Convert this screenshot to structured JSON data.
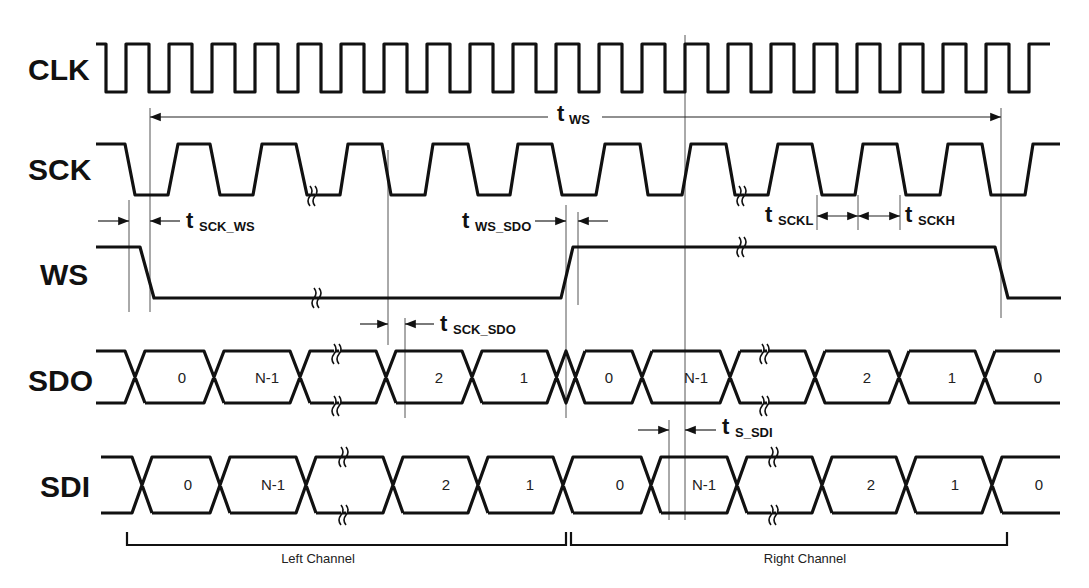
{
  "signals": {
    "clk": "CLK",
    "sck": "SCK",
    "ws": "WS",
    "sdo": "SDO",
    "sdi": "SDI"
  },
  "timing_labels": {
    "t_ws": {
      "main": "t",
      "sub": "WS"
    },
    "t_sck_ws": {
      "main": "t",
      "sub": "SCK_WS"
    },
    "t_ws_sdo": {
      "main": "t",
      "sub": "WS_SDO"
    },
    "t_sckl": {
      "main": "t",
      "sub": "SCKL"
    },
    "t_sckh": {
      "main": "t",
      "sub": "SCKH"
    },
    "t_sck_sdo": {
      "main": "t",
      "sub": "SCK_SDO"
    },
    "t_s_sdi": {
      "main": "t",
      "sub": "S_SDI"
    }
  },
  "sdo_bits": [
    "0",
    "N-1",
    "",
    "2",
    "1",
    "0",
    "N-1",
    "",
    "2",
    "1",
    "0"
  ],
  "sdi_bits": [
    "0",
    "N-1",
    "",
    "2",
    "1",
    "0",
    "N-1",
    "",
    "2",
    "1",
    "0"
  ],
  "channels": {
    "left": "Left Channel",
    "right": "Right Channel"
  },
  "colors": {
    "line": "#111111",
    "guide": "#555555",
    "background": "#ffffff"
  }
}
